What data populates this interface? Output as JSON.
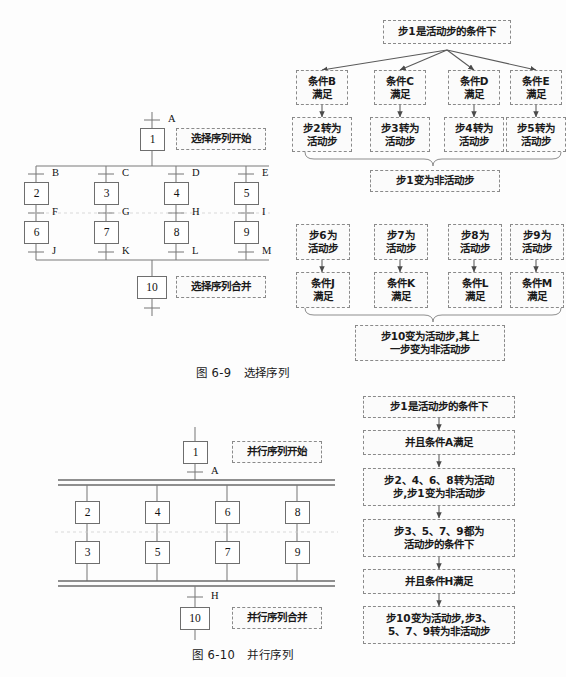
{
  "figure_selection": {
    "caption": "图 6-9   选择序列",
    "steps": [
      {
        "id": "s1",
        "label": "1"
      },
      {
        "id": "s2",
        "label": "2"
      },
      {
        "id": "s3",
        "label": "3"
      },
      {
        "id": "s4",
        "label": "4"
      },
      {
        "id": "s5",
        "label": "5"
      },
      {
        "id": "s6",
        "label": "6"
      },
      {
        "id": "s7",
        "label": "7"
      },
      {
        "id": "s8",
        "label": "8"
      },
      {
        "id": "s9",
        "label": "9"
      },
      {
        "id": "s10",
        "label": "10"
      }
    ],
    "transitions": [
      "A",
      "B",
      "C",
      "D",
      "E",
      "F",
      "G",
      "H",
      "I",
      "J",
      "K",
      "L",
      "M"
    ],
    "notes": {
      "start": "选择序列开始",
      "merge": "选择序列合并"
    }
  },
  "flow_selection_top": {
    "root": "步1是活动步的条件下",
    "conditions": [
      "条件B\n满足",
      "条件C\n满足",
      "条件D\n满足",
      "条件E\n满足"
    ],
    "actions": [
      "步2转为\n活动步",
      "步3转为\n活动步",
      "步4转为\n活动步",
      "步5转为\n活动步"
    ],
    "result": "步1变为非活动步"
  },
  "flow_selection_bottom": {
    "states": [
      "步6为\n活动步",
      "步7为\n活动步",
      "步8为\n活动步",
      "步9为\n活动步"
    ],
    "conditions": [
      "条件J\n满足",
      "条件K\n满足",
      "条件L\n满足",
      "条件M\n满足"
    ],
    "result": "步10变为活动步,其上\n一步变为非活动步"
  },
  "figure_parallel": {
    "caption": "图 6-10   并行序列",
    "steps": [
      {
        "id": "p1",
        "label": "1"
      },
      {
        "id": "p2",
        "label": "2"
      },
      {
        "id": "p4",
        "label": "4"
      },
      {
        "id": "p6",
        "label": "6"
      },
      {
        "id": "p8",
        "label": "8"
      },
      {
        "id": "p3",
        "label": "3"
      },
      {
        "id": "p5",
        "label": "5"
      },
      {
        "id": "p7",
        "label": "7"
      },
      {
        "id": "p9",
        "label": "9"
      },
      {
        "id": "p10",
        "label": "10"
      }
    ],
    "transitions": [
      "A",
      "H"
    ],
    "notes": {
      "start": "并行序列开始",
      "merge": "并行序列合并"
    }
  },
  "flow_parallel": {
    "steps": [
      "步1是活动步的条件下",
      "并且条件A满足",
      "步2、4、6、8转为活动\n步,步1变为非活动步",
      "步3、5、7、9都为\n活动步的条件下",
      "并且条件H满足",
      "步10变为活动步,步3、\n5、7、9转为非活动步"
    ]
  },
  "colors": {
    "line": "#6e6e6e",
    "dashed": "#8a8a8a",
    "text": "#1a1a1a",
    "background": "#fdfdfd"
  }
}
